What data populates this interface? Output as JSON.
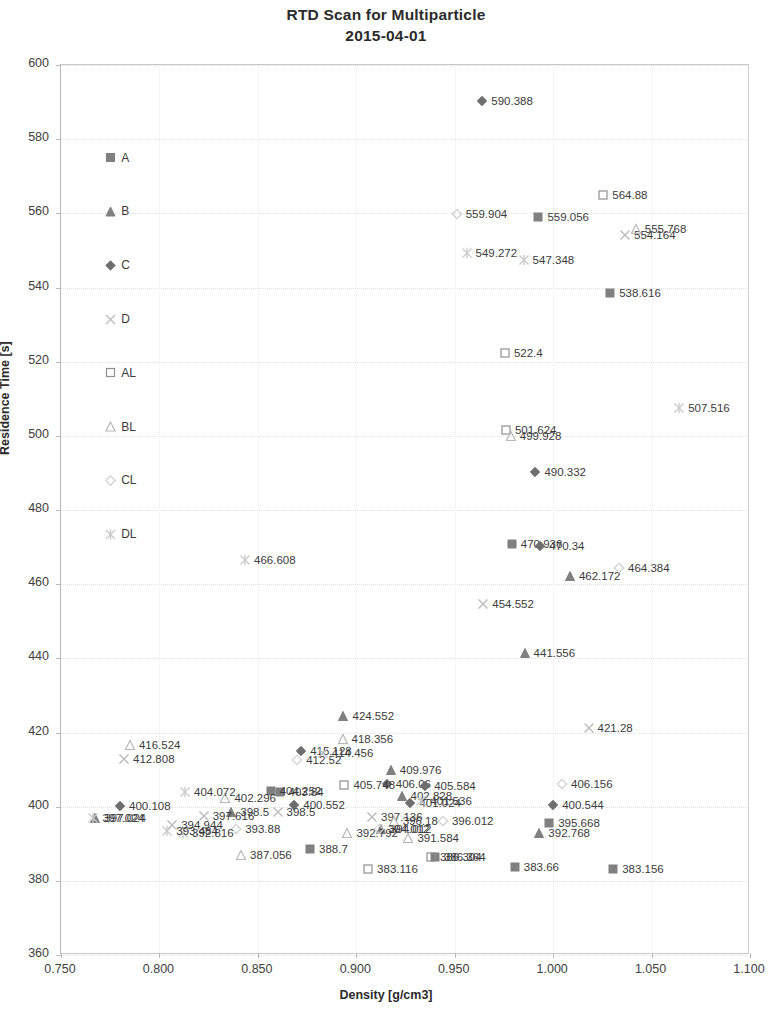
{
  "chart": {
    "type": "scatter",
    "title_line1": "RTD Scan for Multiparticle",
    "title_line2": "2015-04-01",
    "xlabel": "Density [g/cm3]",
    "ylabel": "Residence Time [s]"
  },
  "axes": {
    "x_ticks": [
      "0.750",
      "0.800",
      "0.850",
      "0.900",
      "0.950",
      "1.000",
      "1.050",
      "1.100"
    ],
    "y_ticks": [
      "600",
      "580",
      "560",
      "540",
      "520",
      "500",
      "480",
      "460",
      "440",
      "420",
      "400",
      "380",
      "360"
    ],
    "xlim": [
      0.75,
      1.1
    ],
    "ylim": [
      360,
      600
    ]
  },
  "legend": {
    "items": [
      {
        "label": "A",
        "marker": "filled-square",
        "color": "#808080"
      },
      {
        "label": "B",
        "marker": "filled-triangle",
        "color": "#808080"
      },
      {
        "label": "C",
        "marker": "filled-diamond",
        "color": "#6e6e6e"
      },
      {
        "label": "D",
        "marker": "cross-x",
        "color": "#bdbdbd"
      },
      {
        "label": "AL",
        "marker": "open-square",
        "color": "#8f8f8f"
      },
      {
        "label": "BL",
        "marker": "open-triangle",
        "color": "#b8b8b8"
      },
      {
        "label": "CL",
        "marker": "open-diamond",
        "color": "#cfcfcf"
      },
      {
        "label": "DL",
        "marker": "star-x",
        "color": "#c9c9c9"
      }
    ]
  },
  "chart_data": {
    "type": "scatter",
    "title": "RTD Scan for Multiparticle 2015-04-01",
    "xlabel": "Density [g/cm3]",
    "ylabel": "Residence Time [s]",
    "xlim": [
      0.75,
      1.1
    ],
    "ylim": [
      360,
      600
    ],
    "grid": true,
    "legend_position": "inside-left",
    "series": [
      {
        "name": "A",
        "marker": "filled-square",
        "points": [
          {
            "x": 0.9925,
            "y": 559.056,
            "label": "559.056"
          },
          {
            "x": 1.029,
            "y": 538.616,
            "label": "538.616"
          },
          {
            "x": 0.979,
            "y": 470.936,
            "label": "470.936"
          },
          {
            "x": 0.861,
            "y": 403.84,
            "label": "403.84"
          },
          {
            "x": 0.8565,
            "y": 404.252,
            "label": "404.252"
          },
          {
            "x": 0.998,
            "y": 395.668,
            "label": "395.668"
          },
          {
            "x": 0.9805,
            "y": 383.66,
            "label": "383.66"
          },
          {
            "x": 1.0305,
            "y": 383.156,
            "label": "383.156"
          },
          {
            "x": 0.94,
            "y": 386.364,
            "label": "386.364"
          },
          {
            "x": 0.8765,
            "y": 388.7,
            "label": "388.7"
          }
        ]
      },
      {
        "name": "B",
        "marker": "filled-triangle",
        "points": [
          {
            "x": 1.0085,
            "y": 462.172,
            "label": "462.172"
          },
          {
            "x": 0.9855,
            "y": 441.556,
            "label": "441.556"
          },
          {
            "x": 0.8935,
            "y": 424.552,
            "label": "424.552"
          },
          {
            "x": 0.9175,
            "y": 409.976,
            "label": "409.976"
          },
          {
            "x": 0.923,
            "y": 402.828,
            "label": "402.828"
          },
          {
            "x": 0.7675,
            "y": 397.024,
            "label": "397.024"
          },
          {
            "x": 0.8365,
            "y": 398.5,
            "label": "398.5"
          },
          {
            "x": 0.993,
            "y": 392.768,
            "label": "392.768"
          },
          {
            "x": 0.9125,
            "y": 394.012,
            "label": "394.012"
          }
        ]
      },
      {
        "name": "C",
        "marker": "filled-diamond",
        "points": [
          {
            "x": 0.964,
            "y": 590.388,
            "label": "590.388"
          },
          {
            "x": 0.991,
            "y": 490.332,
            "label": "490.332"
          },
          {
            "x": 0.9935,
            "y": 470.34,
            "label": "470.34"
          },
          {
            "x": 1.0,
            "y": 400.544,
            "label": "400.544"
          },
          {
            "x": 0.78,
            "y": 400.108,
            "label": "400.108"
          },
          {
            "x": 0.872,
            "y": 415.128,
            "label": "415.128"
          },
          {
            "x": 0.9155,
            "y": 406.06,
            "label": "406.06"
          },
          {
            "x": 0.935,
            "y": 405.584,
            "label": "405.584"
          },
          {
            "x": 0.8685,
            "y": 400.552,
            "label": "400.552"
          },
          {
            "x": 0.9275,
            "y": 401.024,
            "label": "401.024"
          }
        ]
      },
      {
        "name": "D",
        "marker": "cross-x",
        "points": [
          {
            "x": 1.0365,
            "y": 554.164,
            "label": "554.164"
          },
          {
            "x": 0.9645,
            "y": 454.552,
            "label": "454.552"
          },
          {
            "x": 1.018,
            "y": 421.28,
            "label": "421.28"
          },
          {
            "x": 0.782,
            "y": 412.808,
            "label": "412.808"
          },
          {
            "x": 0.883,
            "y": 414.456,
            "label": "414.456"
          },
          {
            "x": 0.8225,
            "y": 397.616,
            "label": "397.616"
          },
          {
            "x": 0.8065,
            "y": 394.944,
            "label": "394.944"
          },
          {
            "x": 0.86,
            "y": 398.5,
            "label": "398.5"
          },
          {
            "x": 0.908,
            "y": 397.136,
            "label": "397.136"
          }
        ]
      },
      {
        "name": "AL",
        "marker": "open-square",
        "points": [
          {
            "x": 1.0255,
            "y": 564.88,
            "label": "564.88"
          },
          {
            "x": 0.9755,
            "y": 522.4,
            "label": "522.4"
          },
          {
            "x": 0.976,
            "y": 501.624,
            "label": "501.624"
          },
          {
            "x": 0.894,
            "y": 405.748,
            "label": "405.748"
          },
          {
            "x": 0.906,
            "y": 383.116,
            "label": "383.116"
          },
          {
            "x": 0.938,
            "y": 386.304,
            "label": "386.304"
          }
        ]
      },
      {
        "name": "BL",
        "marker": "open-triangle",
        "points": [
          {
            "x": 1.042,
            "y": 555.768,
            "label": "555.768"
          },
          {
            "x": 0.9785,
            "y": 499.928,
            "label": "499.928"
          },
          {
            "x": 0.785,
            "y": 416.524,
            "label": "416.524"
          },
          {
            "x": 0.893,
            "y": 418.356,
            "label": "418.356"
          },
          {
            "x": 0.8335,
            "y": 402.296,
            "label": "402.296"
          },
          {
            "x": 0.8415,
            "y": 387.056,
            "label": "387.056"
          },
          {
            "x": 0.919,
            "y": 396.18,
            "label": "396.18"
          },
          {
            "x": 0.9265,
            "y": 391.584,
            "label": "391.584"
          },
          {
            "x": 0.8955,
            "y": 392.792,
            "label": "392.792"
          }
        ]
      },
      {
        "name": "CL",
        "marker": "open-diamond",
        "points": [
          {
            "x": 0.951,
            "y": 559.904,
            "label": "559.904"
          },
          {
            "x": 1.0335,
            "y": 464.384,
            "label": "464.384"
          },
          {
            "x": 0.87,
            "y": 412.52,
            "label": "412.52"
          },
          {
            "x": 1.0045,
            "y": 406.156,
            "label": "406.156"
          },
          {
            "x": 0.839,
            "y": 393.88,
            "label": "393.88"
          },
          {
            "x": 0.9115,
            "y": 394.012,
            "label": "394.012"
          },
          {
            "x": 0.944,
            "y": 396.012,
            "label": "396.012"
          }
        ]
      },
      {
        "name": "DL",
        "marker": "star-x",
        "points": [
          {
            "x": 1.064,
            "y": 507.516,
            "label": "507.516"
          },
          {
            "x": 0.956,
            "y": 549.272,
            "label": "549.272"
          },
          {
            "x": 0.985,
            "y": 547.348,
            "label": "547.348"
          },
          {
            "x": 0.8435,
            "y": 466.608,
            "label": "466.608"
          },
          {
            "x": 0.813,
            "y": 404.072,
            "label": "404.072"
          },
          {
            "x": 0.7665,
            "y": 397.024,
            "label": "397.024"
          },
          {
            "x": 0.812,
            "y": 392.816,
            "label": "392.816"
          },
          {
            "x": 0.804,
            "y": 393.484,
            "label": "393.484"
          },
          {
            "x": 0.933,
            "y": 401.536,
            "label": "401.536"
          }
        ]
      }
    ]
  }
}
